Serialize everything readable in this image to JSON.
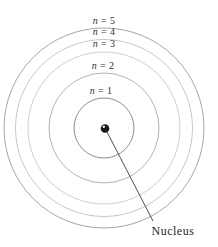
{
  "diagram": {
    "background": "#ffffff",
    "center": {
      "x": 104,
      "y": 128
    },
    "orbits": [
      {
        "id": "n1",
        "var": "n",
        "rest": " = 1",
        "r": 30,
        "stroke": "#8d8d8d",
        "label_x": 101,
        "label_y": 94
      },
      {
        "id": "n2",
        "var": "n",
        "rest": " = 2",
        "r": 55,
        "stroke": "#b2b2b2",
        "label_x": 103,
        "label_y": 69
      },
      {
        "id": "n3",
        "var": "n",
        "rest": " = 3",
        "r": 76,
        "stroke": "#cecece",
        "label_x": 104,
        "label_y": 47
      },
      {
        "id": "n4",
        "var": "n",
        "rest": " = 4",
        "r": 88.5,
        "stroke": "#c8c8c8",
        "label_x": 104,
        "label_y": 35
      },
      {
        "id": "n5",
        "var": "n",
        "rest": " = 5",
        "r": 100,
        "stroke": "#a7a7a7",
        "label_x": 104,
        "label_y": 24
      }
    ],
    "nucleus": {
      "x": 105,
      "y": 128.5,
      "r": 4.3,
      "fill": "#191919",
      "highlight_x": 103.8,
      "highlight_y": 126.8,
      "highlight_r": 1.2,
      "highlight_fill": "#f7f7f7",
      "label": "Nucleus",
      "label_x": 151.5,
      "label_y": 235
    },
    "leader": {
      "x1": 106.5,
      "y1": 131,
      "x2": 153,
      "y2": 221,
      "stroke": "#3b3b3b",
      "width": 0.9
    }
  }
}
